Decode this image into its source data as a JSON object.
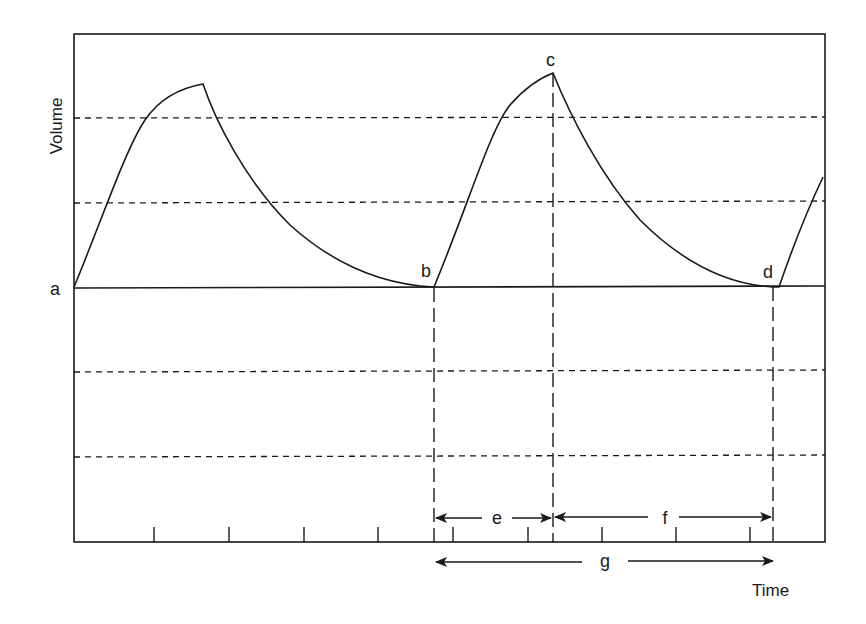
{
  "diagram": {
    "type": "waveform",
    "axes": {
      "ylabel": "Volume",
      "xlabel": "Time"
    },
    "points": {
      "a": "a",
      "b": "b",
      "c": "c",
      "d": "d"
    },
    "intervals": {
      "e": "e",
      "f": "f",
      "g": "g"
    },
    "interval_descriptions": {
      "e": "from b to c (rise)",
      "f": "from c to d (fall)",
      "g": "from b to d (full cycle)"
    },
    "gridlines": {
      "dashed_above_baseline": 2,
      "dashed_below_baseline": 2,
      "baseline": "solid"
    },
    "x_ticks_count": 9,
    "colors": {
      "line": "#1a1a1a",
      "background": "#ffffff"
    }
  }
}
